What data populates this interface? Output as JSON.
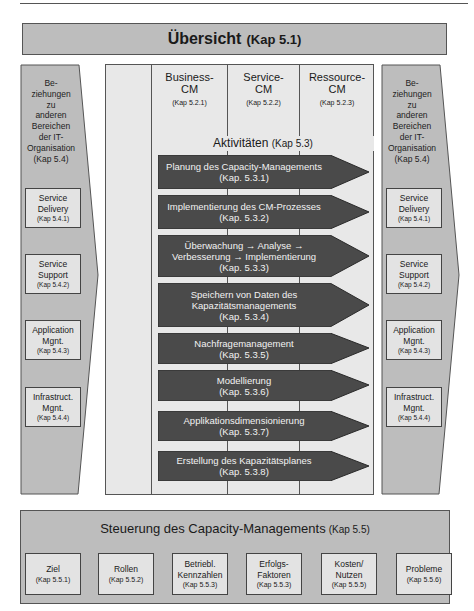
{
  "header": {
    "title": "Übersicht",
    "kap": "(Kap 5.1)"
  },
  "left_panel": {
    "intro_lines": [
      "Be-",
      "ziehungen",
      "zu",
      "anderen",
      "Bereichen",
      "der IT-",
      "Organisation",
      "(Kap 5.4)"
    ],
    "boxes": [
      {
        "line1": "Service",
        "line2": "Delivery",
        "kap": "(Kap 5.4.1)"
      },
      {
        "line1": "Service",
        "line2": "Support",
        "kap": "(Kap 5.4.2)"
      },
      {
        "line1": "Application",
        "line2": "Mgnt.",
        "kap": "(Kap 5.4.3)"
      },
      {
        "line1": "Infrastruct.",
        "line2": "Mgnt.",
        "kap": "(Kap 5.4.4)"
      }
    ]
  },
  "right_panel": {
    "intro_lines": [
      "Be-",
      "ziehungen",
      "zu",
      "anderen",
      "Bereichen",
      "der IT-",
      "Organisation",
      "(Kap 5.4)"
    ],
    "boxes": [
      {
        "line1": "Service",
        "line2": "Delivery",
        "kap": "(Kap 5.4.1)"
      },
      {
        "line1": "Service",
        "line2": "Support",
        "kap": "(Kap 5.4.2)"
      },
      {
        "line1": "Application",
        "line2": "Mgnt.",
        "kap": "(Kap 5.4.3)"
      },
      {
        "line1": "Infrastruct.",
        "line2": "Mgnt.",
        "kap": "(Kap 5.4.4)"
      }
    ]
  },
  "center": {
    "columns": [
      {
        "line1": "Business-",
        "line2": "CM",
        "kap": "(Kap 5.2.1)"
      },
      {
        "line1": "Service-",
        "line2": "CM",
        "kap": "(Kap 5.2.2)"
      },
      {
        "line1": "Ressource-",
        "line2": "CM",
        "kap": "(Kap 5.2.3)"
      }
    ],
    "activities_title": "Aktivitäten",
    "activities_kap": "(Kap 5.3)",
    "activities": [
      {
        "lines": [
          "Planung des Capacity-Managements"
        ],
        "kap": "(Kap. 5.3.1)"
      },
      {
        "lines": [
          "Implementierung des CM-Prozesses"
        ],
        "kap": "(Kap. 5.3.2)"
      },
      {
        "lines": [
          "Überwachung → Analyse →",
          "Verbesserung → Implementierung"
        ],
        "kap": "(Kap. 5.3.3)"
      },
      {
        "lines": [
          "Speichern von Daten des",
          "Kapazitätsmanagements"
        ],
        "kap": "(Kap. 5.3.4)"
      },
      {
        "lines": [
          "Nachfragemanagement"
        ],
        "kap": "(Kap. 5.3.5)"
      },
      {
        "lines": [
          "Modellierung"
        ],
        "kap": "(Kap. 5.3.6)"
      },
      {
        "lines": [
          "Applikationsdimensionierung"
        ],
        "kap": "(Kap. 5.3.7)"
      },
      {
        "lines": [
          "Erstellung des Kapazitätsplanes"
        ],
        "kap": "(Kap. 5.3.8)"
      }
    ]
  },
  "bottom": {
    "title": "Steuerung des Capacity-Managements",
    "kap": "(Kap 5.5)",
    "boxes": [
      {
        "lines": [
          "Ziel"
        ],
        "kap": "(Kap 5.5.1)"
      },
      {
        "lines": [
          "Rollen"
        ],
        "kap": "(Kap 5.5.2)"
      },
      {
        "lines": [
          "Betriebl.",
          "Kennzahlen"
        ],
        "kap": "(Kap 5.5.3)"
      },
      {
        "lines": [
          "Erfolgs-",
          "Faktoren"
        ],
        "kap": "(Kap 5.5.3)"
      },
      {
        "lines": [
          "Kosten/",
          "Nutzen"
        ],
        "kap": "(Kap 5.5.5)"
      },
      {
        "lines": [
          "Probleme"
        ],
        "kap": "(Kap 5.5.6)"
      }
    ]
  },
  "colors": {
    "panel_gray": "#bdbdbd",
    "box_light": "#e3e3e3",
    "center_bg": "#e8e8e8",
    "arrow_dark": "#4a4a4a",
    "border": "#555555"
  }
}
